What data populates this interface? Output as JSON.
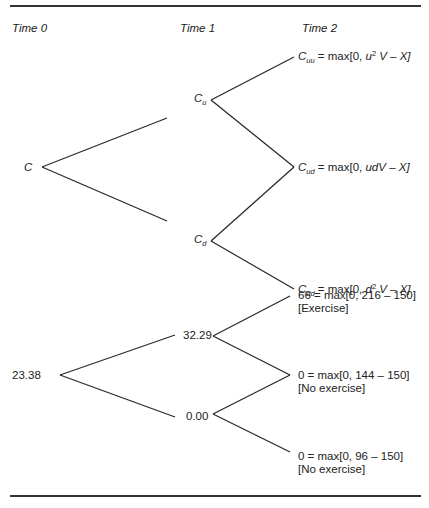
{
  "headers": {
    "time0": "Time 0",
    "time1": "Time 1",
    "time2": "Time 2"
  },
  "symbolic_tree": {
    "root": {
      "label": "C"
    },
    "up": {
      "label": "C",
      "sub": "u"
    },
    "down": {
      "label": "C",
      "sub": "d"
    },
    "uu": {
      "label": "C",
      "sub": "uu",
      "eq": " = max[0, ",
      "var": "u",
      "sup": "2",
      "rest": " V – X]"
    },
    "ud": {
      "label": "C",
      "sub": "ud",
      "eq": " = max[0, ",
      "expr": "udV – X]"
    },
    "dd": {
      "label": "C",
      "sub": "dd",
      "eq": " = max[0, ",
      "var": "d",
      "sup": "2",
      "rest": " V – X]"
    }
  },
  "numeric_tree": {
    "root": "23.38",
    "up": "32.29",
    "down": "0.00",
    "uu": {
      "line1": "66 = max[0, 216 – 150]",
      "line2": "[Exercise]"
    },
    "ud": {
      "line1": "0 = max[0, 144 – 150]",
      "line2": "[No exercise]"
    },
    "dd": {
      "line1": "0 = max[0, 96 – 150]",
      "line2": "[No exercise]"
    }
  }
}
